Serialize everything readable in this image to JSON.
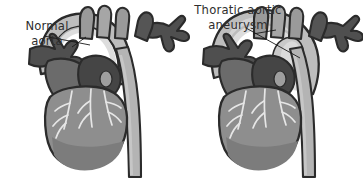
{
  "figure": {
    "background_color": "#ffffff",
    "width": 363,
    "height": 179,
    "style": "grayscale medical illustration, two panels side by side"
  },
  "labels": {
    "left": {
      "name": "normal-aorta-label",
      "line1": "Normal",
      "line2": "aorta",
      "full_text": "Normal aorta",
      "text_color": "#2e2e2e",
      "align": "center",
      "leader_line": "thin black line from label to aortic arch"
    },
    "right": {
      "name": "aneurysm-label",
      "line1": "Thoratic aortic",
      "line2": "aneurysm",
      "full_text": "Thoratic aortic aneurysm",
      "text_color": "#2e2e2e",
      "align": "center",
      "leader_line": "thin black line from label to dilated aortic arch"
    }
  },
  "panels": [
    {
      "id": "left-panel",
      "condition": "normal",
      "label_ref": "labels.left",
      "description": "Heart with normal-caliber aortic arch and descending aorta",
      "anatomy": [
        {
          "name": "aortic-arch",
          "state": "normal caliber, smooth curve",
          "color": "#b9b9b9"
        },
        {
          "name": "ascending-aorta",
          "state": "normal",
          "color": "#c3c3c3"
        },
        {
          "name": "descending-aorta",
          "state": "normal straight tube",
          "color": "#b4b4b4"
        },
        {
          "name": "brachiocephalic-branches",
          "state": "three great vessels",
          "color": "#9a9a9a"
        },
        {
          "name": "superior-vena-cava",
          "state": "normal",
          "color": "#6f6f6f"
        },
        {
          "name": "pulmonary-artery-trunk",
          "state": "normal",
          "color": "#4a4a4a"
        },
        {
          "name": "pulmonary-branches-left",
          "state": "branching fan",
          "color": "#4f4f4f"
        },
        {
          "name": "pulmonary-branches-right",
          "state": "branching fan",
          "color": "#4f4f4f"
        },
        {
          "name": "heart-ventricles",
          "state": "normal",
          "color": "#8e8e8e"
        },
        {
          "name": "coronary-arteries",
          "state": "visible branching network",
          "color": "#e8e8e8"
        }
      ]
    },
    {
      "id": "right-panel",
      "condition": "aneurysm",
      "label_ref": "labels.right",
      "description": "Heart with dilated, bulging thoracic aortic arch forming an aneurysm",
      "anatomy": [
        {
          "name": "aortic-arch",
          "state": "dilated and bulging (aneurysm)",
          "color": "#b9b9b9"
        },
        {
          "name": "ascending-aorta",
          "state": "widened",
          "color": "#c3c3c3"
        },
        {
          "name": "descending-aorta",
          "state": "normal straight tube",
          "color": "#b4b4b4"
        },
        {
          "name": "brachiocephalic-branches",
          "state": "three great vessels",
          "color": "#9a9a9a"
        },
        {
          "name": "superior-vena-cava",
          "state": "normal",
          "color": "#6f6f6f"
        },
        {
          "name": "pulmonary-artery-trunk",
          "state": "normal",
          "color": "#4a4a4a"
        },
        {
          "name": "pulmonary-branches-left",
          "state": "branching fan",
          "color": "#4f4f4f"
        },
        {
          "name": "pulmonary-branches-right",
          "state": "branching fan",
          "color": "#4f4f4f"
        },
        {
          "name": "heart-ventricles",
          "state": "normal",
          "color": "#8e8e8e"
        },
        {
          "name": "coronary-arteries",
          "state": "visible branching network",
          "color": "#e8e8e8"
        }
      ]
    }
  ],
  "palette": {
    "background": "#ffffff",
    "outline": "#2b2b2b",
    "text": "#2e2e2e",
    "aorta_light": "#bdbdbd",
    "aorta_mid": "#a8a8a8",
    "vessel_dark": "#4a4a4a",
    "vessel_mid": "#6f6f6f",
    "heart_body": "#8e8e8e",
    "heart_shadow": "#7c7c7c",
    "coronary": "#e6e6e6",
    "highlight": "#d6d6d6"
  }
}
